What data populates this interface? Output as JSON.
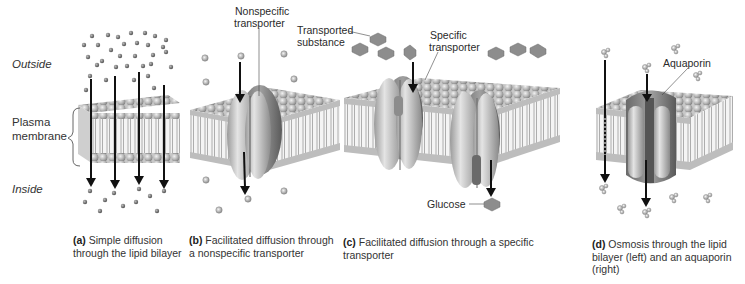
{
  "figure": {
    "side_labels": {
      "outside": "Outside",
      "plasma_membrane_line1": "Plasma",
      "plasma_membrane_line2": "membrane",
      "inside": "Inside"
    },
    "callouts": {
      "nonspecific_line1": "Nonspecific",
      "nonspecific_line2": "transporter",
      "transported_line1": "Transported",
      "transported_line2": "substance",
      "specific_line1": "Specific",
      "specific_line2": "transporter",
      "glucose": "Glucose",
      "aquaporin": "Aquaporin"
    },
    "panels": [
      {
        "letter": "(a)",
        "line1": "Simple diffusion",
        "line2": "through the lipid bilayer",
        "line3": ""
      },
      {
        "letter": "(b)",
        "line1": "Facilitated diffusion through",
        "line2": "a nonspecific transporter",
        "line3": ""
      },
      {
        "letter": "(c)",
        "line1": "Facilitated diffusion through a specific",
        "line2": "transporter",
        "line3": ""
      },
      {
        "letter": "(d)",
        "line1": "Osmosis through the lipid",
        "line2": "bilayer (left) and an aquaporin",
        "line3": "(right)"
      }
    ]
  }
}
